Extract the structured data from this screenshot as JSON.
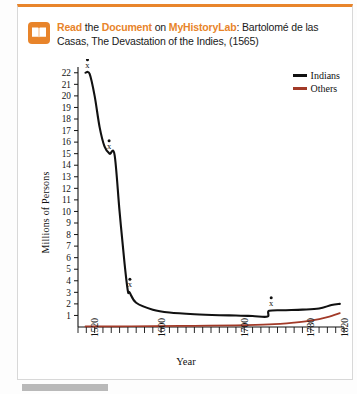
{
  "panel": {
    "accent_color": "#e8842a",
    "border_color": "#d8d8d8"
  },
  "header": {
    "icon": "book-icon",
    "read_label": "Read",
    "the_label": " the ",
    "document_label": "Document",
    "on_label": " on ",
    "myhistorylab_label": "MyHistoryLab",
    "colon_label": ":",
    "citation": " Bartolomé de las Casas, The Devastation of the Indies, (1565)"
  },
  "chart_data": {
    "type": "line",
    "title": "",
    "xlabel": "Year",
    "ylabel": "Millions of Persons",
    "xlim": [
      1510,
      1830
    ],
    "ylim": [
      0,
      22.5
    ],
    "grid": false,
    "legend_position": "top-right",
    "y_ticks": [
      1,
      2,
      3,
      4,
      5,
      6,
      7,
      8,
      9,
      10,
      11,
      12,
      13,
      14,
      15,
      16,
      17,
      18,
      19,
      20,
      21,
      22
    ],
    "x_ticks": [
      1520,
      1600,
      1700,
      1780,
      1820
    ],
    "x_minor_tick_step": 10,
    "annotations": [
      {
        "label": "x",
        "x": 1519,
        "y": 22.0
      },
      {
        "label": "x",
        "x": 1545,
        "y": 15.0
      },
      {
        "label": "x",
        "x": 1570,
        "y": 3.0
      },
      {
        "label": "x",
        "x": 1740,
        "y": 1.4
      }
    ],
    "series": [
      {
        "name": "Indians",
        "color": "#111111",
        "x": [
          1519,
          1524,
          1530,
          1536,
          1542,
          1548,
          1554,
          1560,
          1566,
          1570,
          1572,
          1580,
          1600,
          1620,
          1650,
          1680,
          1700,
          1720,
          1738,
          1740,
          1760,
          1780,
          1800,
          1815,
          1825
        ],
        "values": [
          22.0,
          21.9,
          20.0,
          17.3,
          15.6,
          15.0,
          14.9,
          10.0,
          5.5,
          3.1,
          3.0,
          2.1,
          1.5,
          1.25,
          1.1,
          1.02,
          1.0,
          0.95,
          0.9,
          1.4,
          1.45,
          1.5,
          1.6,
          1.9,
          2.0
        ]
      },
      {
        "name": "Others",
        "color": "#a23a28",
        "x": [
          1519,
          1560,
          1600,
          1650,
          1700,
          1740,
          1770,
          1790,
          1810,
          1825
        ],
        "values": [
          0.05,
          0.06,
          0.08,
          0.1,
          0.14,
          0.22,
          0.38,
          0.55,
          0.85,
          1.2
        ]
      }
    ]
  },
  "legend": {
    "items": [
      {
        "label": "Indians",
        "color": "#111111"
      },
      {
        "label": "Others",
        "color": "#a23a28"
      }
    ]
  }
}
